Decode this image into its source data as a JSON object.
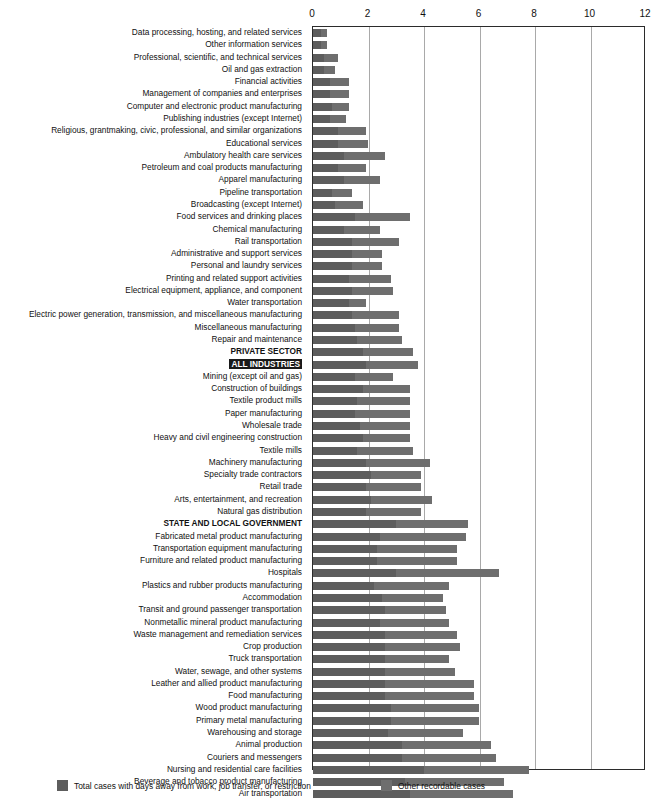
{
  "chart_data": {
    "type": "bar",
    "orientation": "horizontal",
    "stacked": true,
    "title": "",
    "xlabel": "",
    "ylabel": "",
    "xlim": [
      0,
      12
    ],
    "xticks": [
      0,
      2,
      4,
      6,
      8,
      10,
      12
    ],
    "xtick_labels": [
      "0",
      "2",
      "4",
      "6",
      "8",
      "10",
      "12"
    ],
    "grid": true,
    "grid_axis": "x",
    "legend_position": "bottom",
    "colors": {
      "series_a": "#5d5d5d",
      "series_b": "#6e6e6e",
      "gridline": "#a9a9a9",
      "axis": "#2b2b2b",
      "text": "#111111",
      "highlight_bg": "#1a1a1a",
      "highlight_fg": "#ffffff"
    },
    "series": [
      {
        "name": "Total cases with days away from work, job transfer, or restriction",
        "color": "#5d5d5d"
      },
      {
        "name": "Other recordable cases",
        "color": "#6e6e6e"
      }
    ],
    "categories": [
      "Data processing, hosting, and related services",
      "Other information services",
      "Professional, scientific, and technical services",
      "Oil and gas extraction",
      "Financial activities",
      "Management of companies and enterprises",
      "Computer and electronic product manufacturing",
      "Publishing industries (except Internet)",
      "Religious, grantmaking, civic, professional, and similar organizations",
      "Educational services",
      "Ambulatory health care services",
      "Petroleum and coal products manufacturing",
      "Apparel manufacturing",
      "Pipeline transportation",
      "Broadcasting (except Internet)",
      "Food services and drinking places",
      "Chemical manufacturing",
      "Rail transportation",
      "Administrative and support services",
      "Personal and laundry services",
      "Printing and related support activities",
      "Electrical equipment, appliance, and component",
      "Water transportation",
      "Electric power generation, transmission, and miscellaneous manufacturing",
      "Miscellaneous manufacturing",
      "Repair and maintenance",
      "PRIVATE SECTOR",
      "ALL INDUSTRIES",
      "Mining (except oil and gas)",
      "Construction of buildings",
      "Textile product mills",
      "Paper manufacturing",
      "Wholesale trade",
      "Heavy and civil engineering construction",
      "Textile mills",
      "Machinery manufacturing",
      "Specialty trade contractors",
      "Retail trade",
      "Arts, entertainment, and recreation",
      "Natural gas distribution",
      "STATE AND LOCAL GOVERNMENT",
      "Fabricated metal product manufacturing",
      "Transportation equipment manufacturing",
      "Furniture and related product manufacturing",
      "Hospitals",
      "Plastics and rubber products manufacturing",
      "Accommodation",
      "Transit and ground passenger transportation",
      "Nonmetallic mineral product manufacturing",
      "Waste management and remediation services",
      "Crop production",
      "Truck transportation",
      "Water, sewage, and other systems",
      "Leather and allied product manufacturing",
      "Food manufacturing",
      "Wood product manufacturing",
      "Primary metal manufacturing",
      "Warehousing and storage",
      "Animal production",
      "Couriers and messengers",
      "Nursing and residential care facilities",
      "Beverage and tobacco product manufacturing",
      "Air transportation"
    ],
    "emphasis": {
      "bold": [
        "PRIVATE SECTOR",
        "ALL INDUSTRIES",
        "STATE AND LOCAL GOVERNMENT"
      ],
      "inverted": [
        "ALL INDUSTRIES"
      ]
    },
    "series_values": {
      "Total cases with days away from work, job transfer, or restriction": [
        0.3,
        0.3,
        0.4,
        0.4,
        0.6,
        0.6,
        0.7,
        0.6,
        0.9,
        0.9,
        1.1,
        0.9,
        1.1,
        0.7,
        0.8,
        1.5,
        1.1,
        1.4,
        1.4,
        1.4,
        1.3,
        1.4,
        1.3,
        1.4,
        1.5,
        1.6,
        1.8,
        1.9,
        1.5,
        1.8,
        1.6,
        1.5,
        1.7,
        1.8,
        1.6,
        1.9,
        2.1,
        1.9,
        2.1,
        1.9,
        3.0,
        2.4,
        2.3,
        2.3,
        3.0,
        2.2,
        2.5,
        2.6,
        2.4,
        2.6,
        2.6,
        2.6,
        2.6,
        2.6,
        2.6,
        2.8,
        2.8,
        2.7,
        3.2,
        3.2,
        4.0,
        3.3,
        3.5
      ],
      "Other recordable cases": [
        0.2,
        0.2,
        0.5,
        0.4,
        0.7,
        0.7,
        0.6,
        0.6,
        1.0,
        1.1,
        1.5,
        1.0,
        1.3,
        0.7,
        1.0,
        2.0,
        1.3,
        1.7,
        1.1,
        1.1,
        1.5,
        1.5,
        0.6,
        1.7,
        1.6,
        1.6,
        1.8,
        1.9,
        1.4,
        1.7,
        1.9,
        2.0,
        1.8,
        1.7,
        2.0,
        2.3,
        1.8,
        2.0,
        2.2,
        2.0,
        2.6,
        3.1,
        2.9,
        2.9,
        3.7,
        2.7,
        2.2,
        2.2,
        2.5,
        2.6,
        2.7,
        2.3,
        2.5,
        3.2,
        3.2,
        3.2,
        3.2,
        2.7,
        3.2,
        3.4,
        3.8,
        3.6,
        3.7
      ],
      "Total": [
        0.5,
        0.5,
        0.9,
        0.8,
        1.3,
        1.3,
        1.3,
        1.2,
        1.9,
        2.0,
        2.6,
        1.9,
        2.4,
        1.4,
        1.8,
        3.5,
        2.4,
        3.1,
        2.5,
        2.5,
        2.8,
        2.9,
        1.9,
        3.1,
        3.1,
        3.2,
        3.6,
        3.8,
        2.9,
        3.5,
        3.5,
        3.5,
        3.5,
        3.5,
        3.6,
        4.2,
        3.9,
        3.9,
        4.3,
        3.9,
        5.6,
        5.5,
        5.2,
        5.2,
        6.7,
        4.9,
        4.7,
        4.8,
        4.9,
        5.2,
        5.3,
        4.9,
        5.1,
        5.8,
        5.8,
        6.0,
        6.0,
        5.4,
        6.4,
        6.6,
        7.8,
        6.9,
        7.2
      ]
    }
  },
  "legend": {
    "items": [
      {
        "label": "Total cases with days away from work, job transfer, or restriction",
        "color": "#5d5d5d"
      },
      {
        "label": "Other recordable cases",
        "color": "#6e6e6e"
      }
    ]
  }
}
